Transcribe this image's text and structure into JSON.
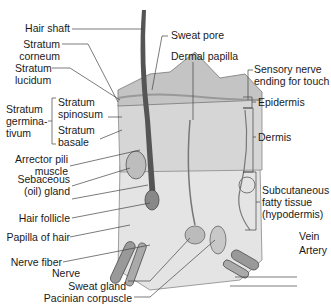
{
  "diagram": {
    "type": "anatomical cross-section",
    "colors": {
      "line": "#444444",
      "tissue": "#d9d9d9",
      "tissue_dark": "#9a9a9a",
      "background": "#ffffff"
    },
    "labels_left": [
      {
        "id": "hair-shaft",
        "text": "Hair shaft"
      },
      {
        "id": "stratum-corneum",
        "line1": "Stratum",
        "line2": "corneum"
      },
      {
        "id": "stratum-lucidum",
        "line1": "Stratum",
        "line2": "lucidum"
      },
      {
        "id": "stratum-germinativum",
        "line1": "Stratum",
        "line2": "germina-",
        "line3": "tivum"
      },
      {
        "id": "stratum-spinosum",
        "line1": "Stratum",
        "line2": "spinosum"
      },
      {
        "id": "stratum-basale",
        "line1": "Stratum",
        "line2": "basale"
      },
      {
        "id": "arrector-pili",
        "line1": "Arrector pili",
        "line2": "muscle"
      },
      {
        "id": "sebaceous-gland",
        "line1": "Sebaceous",
        "line2": "(oil) gland"
      },
      {
        "id": "hair-follicle",
        "text": "Hair follicle"
      },
      {
        "id": "papilla-of-hair",
        "text": "Papilla of hair"
      },
      {
        "id": "nerve-fiber",
        "text": "Nerve fiber"
      },
      {
        "id": "nerve",
        "text": "Nerve"
      },
      {
        "id": "sweat-gland",
        "text": "Sweat gland"
      },
      {
        "id": "pacinian-corpuscle",
        "text": "Pacinian corpuscle"
      }
    ],
    "labels_top": [
      {
        "id": "sweat-pore",
        "text": "Sweat pore"
      },
      {
        "id": "dermal-papilla",
        "text": "Dermal papilla"
      }
    ],
    "labels_right": [
      {
        "id": "sensory-nerve",
        "line1": "Sensory nerve",
        "line2": "ending for touch"
      },
      {
        "id": "epidermis",
        "text": "Epidermis"
      },
      {
        "id": "dermis",
        "text": "Dermis"
      },
      {
        "id": "subcutaneous",
        "line1": "Subcutaneous",
        "line2": "fatty tissue",
        "line3": "(hypodermis)"
      },
      {
        "id": "vein",
        "text": "Vein"
      },
      {
        "id": "artery",
        "text": "Artery"
      }
    ]
  }
}
